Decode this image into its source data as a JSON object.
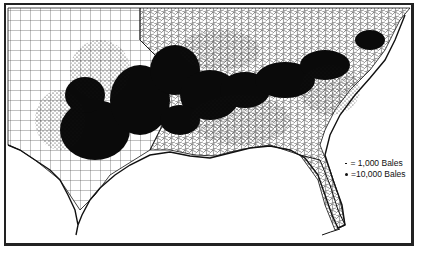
{
  "map": {
    "subject": "Cotton production dot-density map, southern United States",
    "region": "Southern United States (Texas to the Carolinas, Florida)",
    "colors": {
      "ink": "#111111",
      "background": "#ffffff",
      "frame": "#222222"
    }
  },
  "legend": {
    "items": [
      {
        "symbol": "small-dot",
        "label": "= 1,000 Bales"
      },
      {
        "symbol": "large-dot",
        "label": "=10,000 Bales"
      }
    ]
  }
}
